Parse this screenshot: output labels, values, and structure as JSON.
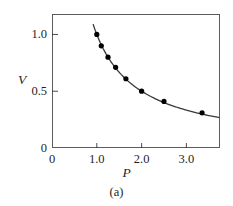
{
  "figure": {
    "caption": "(a)",
    "background_color": "#ffffff",
    "frame_color": "#5d5b5c",
    "ink_color": "#221f1f"
  },
  "chart_data": {
    "type": "scatter",
    "title": "",
    "subtitle": "",
    "caption": "(a)",
    "xlabel": "P",
    "ylabel": "V",
    "xlim": [
      0,
      3.75
    ],
    "ylim": [
      0,
      1.18
    ],
    "xticks": [
      0,
      1.0,
      2.0,
      3.0
    ],
    "xtick_labels": [
      "0",
      "1.0",
      "2.0",
      "3.0"
    ],
    "yticks": [
      0,
      0.5,
      1.0
    ],
    "ytick_labels": [
      "0",
      "0.5",
      "1.0"
    ],
    "grid": false,
    "legend": null,
    "tick_direction": "in",
    "frame": "box",
    "marker": "filled-circle",
    "marker_color": "#000000",
    "line_color": "#3a3838",
    "relationship": "PV = 1 (inverse / isotherm)",
    "points": [
      {
        "P": 1.0,
        "V": 1.0
      },
      {
        "P": 1.1,
        "V": 0.9
      },
      {
        "P": 1.25,
        "V": 0.8
      },
      {
        "P": 1.42,
        "V": 0.71
      },
      {
        "P": 1.65,
        "V": 0.61
      },
      {
        "P": 2.0,
        "V": 0.5
      },
      {
        "P": 2.5,
        "V": 0.41
      },
      {
        "P": 3.35,
        "V": 0.31
      }
    ],
    "curve": {
      "x_start": 0.92,
      "x_end": 3.72,
      "description": "smooth monotonically decreasing hyperbola through the data points"
    }
  }
}
